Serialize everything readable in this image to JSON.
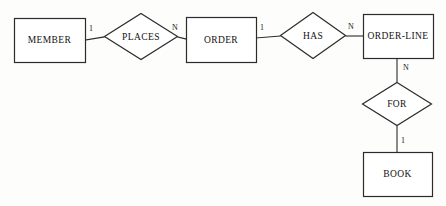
{
  "diagram": {
    "kind": "entity-relationship-diagram",
    "title": "",
    "background_color": "#fdfdfb",
    "line_color": "#2b2b2b",
    "text_color": "#111111",
    "entities": [
      {
        "id": "member",
        "label": "MEMBER",
        "shape": "rectangle",
        "x": 14,
        "y": 18,
        "w": 71,
        "h": 44
      },
      {
        "id": "order",
        "label": "ORDER",
        "shape": "rectangle",
        "x": 186,
        "y": 17,
        "w": 70,
        "h": 45
      },
      {
        "id": "order_line",
        "label": "ORDER-LINE",
        "shape": "rectangle",
        "x": 363,
        "y": 14,
        "w": 70,
        "h": 44
      },
      {
        "id": "book",
        "label": "BOOK",
        "shape": "rectangle",
        "x": 363,
        "y": 152,
        "w": 69,
        "h": 44
      }
    ],
    "relationships": [
      {
        "id": "places",
        "label": "PLACES",
        "shape": "diamond",
        "x": 104,
        "y": 13,
        "w": 74,
        "h": 47
      },
      {
        "id": "has",
        "label": "HAS",
        "shape": "diamond",
        "x": 280,
        "y": 12,
        "w": 66,
        "h": 47
      },
      {
        "id": "for",
        "label": "FOR",
        "shape": "diamond",
        "x": 362,
        "y": 82,
        "w": 70,
        "h": 44
      }
    ],
    "connections": [
      {
        "id": "member-places",
        "from": "member",
        "to": "places",
        "x1": 85,
        "y1": 40,
        "x2": 104,
        "y2": 37
      },
      {
        "id": "places-order",
        "from": "places",
        "to": "order",
        "x1": 178,
        "y1": 37,
        "x2": 186,
        "y2": 39
      },
      {
        "id": "order-has",
        "from": "order",
        "to": "has",
        "x1": 256,
        "y1": 38,
        "x2": 280,
        "y2": 36
      },
      {
        "id": "has-orderline",
        "from": "has",
        "to": "order_line",
        "x1": 346,
        "y1": 36,
        "x2": 363,
        "y2": 36
      },
      {
        "id": "orderline-for",
        "from": "order_line",
        "to": "for",
        "x1": 397,
        "y1": 58,
        "x2": 397,
        "y2": 82
      },
      {
        "id": "for-book",
        "from": "for",
        "to": "book",
        "x1": 397,
        "y1": 126,
        "x2": 397,
        "y2": 152
      }
    ],
    "cardinalities": [
      {
        "id": "card-member",
        "label": "1",
        "x": 89,
        "y": 25
      },
      {
        "id": "card-places-order",
        "label": "N",
        "x": 172,
        "y": 24
      },
      {
        "id": "card-order-has",
        "label": "1",
        "x": 260,
        "y": 24
      },
      {
        "id": "card-has-orderline",
        "label": "N",
        "x": 348,
        "y": 23
      },
      {
        "id": "card-orderline-for",
        "label": "N",
        "x": 403,
        "y": 64
      },
      {
        "id": "card-for-book",
        "label": "1",
        "x": 401,
        "y": 137
      }
    ]
  }
}
